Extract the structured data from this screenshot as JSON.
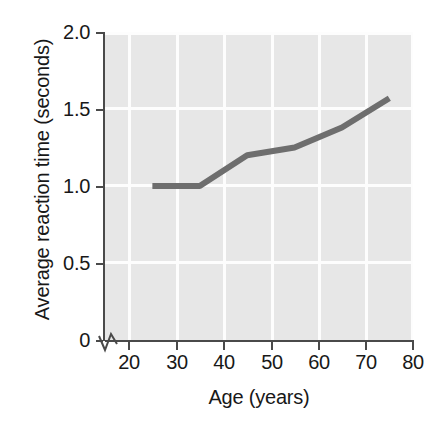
{
  "chart_data": {
    "type": "line",
    "title": "",
    "xlabel": "Age (years)",
    "ylabel": "Average reaction time (seconds)",
    "x": [
      25,
      35,
      45,
      55,
      65,
      75
    ],
    "values": [
      1.0,
      1.0,
      1.2,
      1.25,
      1.38,
      1.57
    ],
    "series": [
      {
        "name": "Average reaction time",
        "x": [
          25,
          35,
          45,
          55,
          65,
          75
        ],
        "values": [
          1.0,
          1.0,
          1.2,
          1.25,
          1.38,
          1.57
        ]
      }
    ],
    "xlim": [
      15,
      80
    ],
    "ylim": [
      0,
      2.0
    ],
    "xticks": [
      20,
      30,
      40,
      50,
      60,
      70,
      80
    ],
    "xtick_labels": [
      "20",
      "30",
      "40",
      "50",
      "60",
      "70",
      "80"
    ],
    "yticks": [
      0,
      0.5,
      1.0,
      1.5,
      2.0
    ],
    "ytick_labels": [
      "0",
      "0.5",
      "1.0",
      "1.5",
      "2.0"
    ],
    "grid": true,
    "legend": "none",
    "axis_break": "y-axis break near origin",
    "colors": {
      "line": "#6e6e6e",
      "plot_background": "#e7e7e7",
      "gridline": "#fdfdfd",
      "axis": "#4a4a4a",
      "text": "#181818",
      "figure_background": "#ffffff"
    },
    "line_width": 6
  }
}
